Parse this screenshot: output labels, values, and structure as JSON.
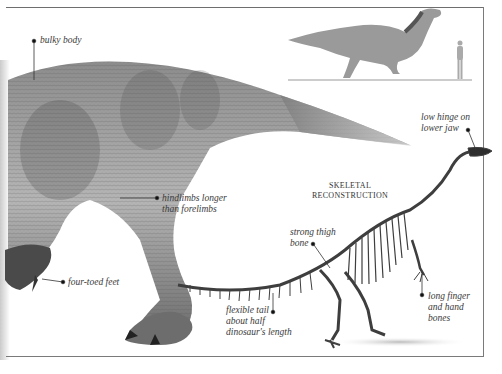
{
  "figure": {
    "labels": {
      "bulky_body": "bulky body",
      "hindlimbs": "hindlimbs longer\nthan forelimbs",
      "four_toed_feet": "four-toed feet",
      "low_hinge": "low hinge on\nlower jaw",
      "strong_thigh": "strong thigh\nbone",
      "flexible_tail": "flexible tail\nabout half\ndinosaur's length",
      "long_finger": "long finger\nand hand\nbones"
    },
    "skeletal_title": "SKELETAL\nRECONSTRUCTION",
    "scale_figure": "human-silhouette",
    "colors": {
      "ink": "#3a3a3a",
      "frame": "#6e6e6e",
      "skin_dark": "#5a5a5a",
      "skin_light": "#a8a8a8",
      "bone": "#4a4a4a"
    }
  }
}
